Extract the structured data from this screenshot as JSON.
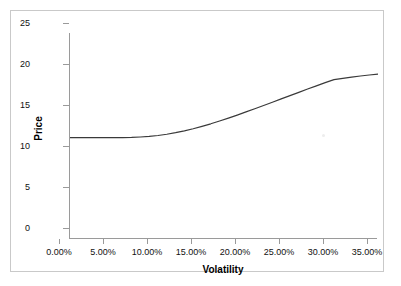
{
  "chart_data": {
    "type": "line",
    "title": "",
    "xlabel": "Volatility",
    "ylabel": "Price",
    "xlim": [
      0,
      35
    ],
    "ylim": [
      0,
      25
    ],
    "grid": false,
    "legend": null,
    "x_tick_labels": [
      "0.00%",
      "5.00%",
      "10.00%",
      "15.00%",
      "20.00%",
      "25.00%",
      "30.00%",
      "35.00%"
    ],
    "x_tick_values": [
      0,
      5,
      10,
      15,
      20,
      25,
      30,
      35
    ],
    "y_tick_labels": [
      "0",
      "5",
      "10",
      "15",
      "20",
      "25"
    ],
    "y_tick_values": [
      0,
      5,
      10,
      15,
      20,
      25
    ],
    "series": [
      {
        "name": "Price",
        "color": "#3a3a3a",
        "x": [
          0,
          1,
          2,
          3,
          4,
          5,
          6,
          7,
          8,
          9,
          10,
          11,
          12,
          13,
          14,
          15,
          16,
          17,
          18,
          19,
          20,
          21,
          22,
          23,
          24,
          25,
          26,
          27,
          28,
          29,
          30,
          31,
          32,
          33,
          34,
          35
        ],
        "values": [
          12.3,
          12.3,
          12.3,
          12.3,
          12.3,
          12.3,
          12.31,
          12.33,
          12.38,
          12.45,
          12.56,
          12.71,
          12.9,
          13.12,
          13.38,
          13.67,
          13.98,
          14.32,
          14.67,
          15.04,
          15.42,
          15.81,
          16.2,
          16.6,
          17.0,
          17.4,
          17.8,
          18.2,
          18.59,
          18.97,
          19.34,
          19.5,
          19.65,
          19.78,
          19.9,
          20.0
        ]
      }
    ]
  },
  "axes": {
    "x_title": "Volatility",
    "y_title": "Price"
  },
  "colors": {
    "line": "#3a3a3a",
    "axis": "#9a9a9a",
    "frame": "#c9c9c9",
    "text": "#111111",
    "background": "#ffffff"
  }
}
